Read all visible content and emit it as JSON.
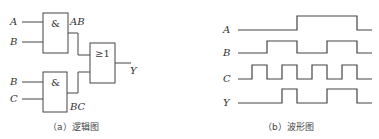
{
  "logic_diagram": {
    "caption": "（a）逻辑图",
    "inputs": {
      "gate1_in1": "A",
      "gate1_in2": "B",
      "gate2_in1": "B",
      "gate2_in2": "C"
    },
    "gates": [
      {
        "id": "and1",
        "symbol": "&",
        "output_label": "AB"
      },
      {
        "id": "and2",
        "symbol": "&",
        "output_label": "BC"
      },
      {
        "id": "or1",
        "symbol": "≥1",
        "output_label": "Y"
      }
    ]
  },
  "waveform_diagram": {
    "caption": "（b）波形图",
    "signals": [
      {
        "name": "A",
        "levels": [
          0,
          0,
          0,
          0,
          1,
          1,
          1,
          1,
          0
        ]
      },
      {
        "name": "B",
        "levels": [
          0,
          0,
          1,
          1,
          0,
          0,
          1,
          1,
          0
        ]
      },
      {
        "name": "C",
        "levels": [
          0,
          1,
          0,
          1,
          0,
          1,
          0,
          1,
          0
        ]
      },
      {
        "name": "Y",
        "levels": [
          0,
          0,
          0,
          1,
          0,
          0,
          1,
          1,
          0
        ]
      }
    ]
  }
}
